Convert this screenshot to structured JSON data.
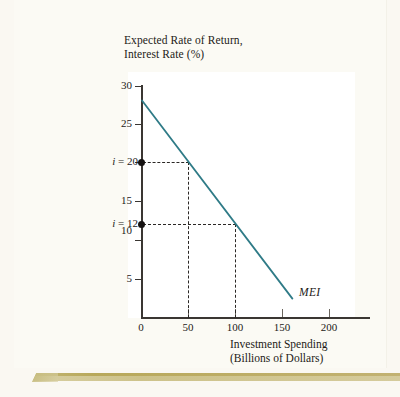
{
  "chart_data": {
    "type": "line",
    "title": "Expected Rate of Return, Interest Rate (%)",
    "title_lines": [
      "Expected Rate of Return,",
      "Interest Rate (%)"
    ],
    "xlabel": "Investment Spending (Billions of Dollars)",
    "xlabel_lines": [
      "Investment Spending",
      "(Billions of Dollars)"
    ],
    "ylabel": "Expected Rate of Return, Interest Rate (%)",
    "xlim": [
      0,
      215
    ],
    "ylim": [
      0,
      30
    ],
    "grid": false,
    "legend_position": "inline-right",
    "x_ticks": [
      {
        "value": 0,
        "label": "0"
      },
      {
        "value": 50,
        "label": "50"
      },
      {
        "value": 100,
        "label": "100"
      },
      {
        "value": 150,
        "label": "150"
      },
      {
        "value": 200,
        "label": "200"
      }
    ],
    "y_ticks": [
      {
        "value": 5,
        "label": "5"
      },
      {
        "value": 10,
        "label": "10"
      },
      {
        "value": 15,
        "label": "15"
      },
      {
        "value": 20,
        "label": "20"
      },
      {
        "value": 25,
        "label": "25"
      },
      {
        "value": 30,
        "label": "30"
      }
    ],
    "series": [
      {
        "name": "MEI",
        "label": "MEI",
        "color": "#2f7b87",
        "points": [
          {
            "x": 0,
            "y": 28
          },
          {
            "x": 160,
            "y": 2.5
          }
        ]
      }
    ],
    "annotations": [
      {
        "name": "i-equals-20",
        "label": "i = 20",
        "label_prefix": "i",
        "label_suffix": "= 20",
        "y": 20,
        "x": 50,
        "marker": true,
        "guide": "dashed"
      },
      {
        "name": "i-equals-12",
        "label": "i = 12",
        "label_prefix": "i",
        "label_suffix": "= 12",
        "y": 12,
        "x": 100,
        "marker": true,
        "guide": "dashed"
      }
    ],
    "colors": {
      "curve": "#2f7b87",
      "axis": "#3a3632",
      "text": "#1d1a17",
      "plot_background": "#ffffff",
      "page_background": "#fbfaf4",
      "page_edge": "#cdc28a"
    }
  }
}
